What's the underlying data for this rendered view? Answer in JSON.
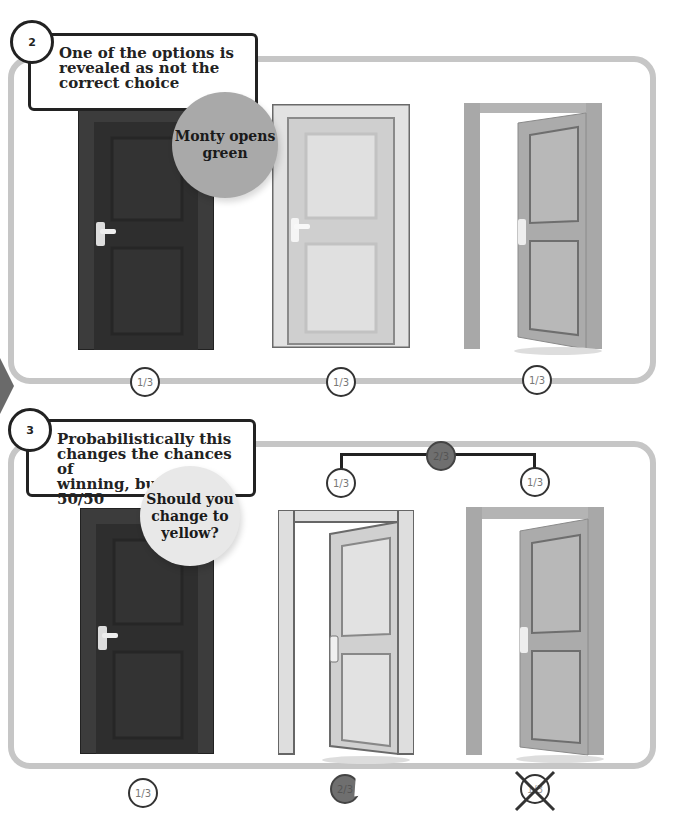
{
  "steps": [
    {
      "number": "2",
      "caption": [
        "One of the options is",
        "revealed as not the",
        "correct choice"
      ],
      "bubble": {
        "lines": [
          "Monty opens",
          "green"
        ],
        "color": "#a9a9a9"
      },
      "doors": [
        {
          "position": "left",
          "style": "dark-closed",
          "color": "#3a3a3a"
        },
        {
          "position": "middle",
          "style": "light-closed",
          "color": "#d6d6d6"
        },
        {
          "position": "right",
          "style": "open",
          "color": "#a8a8a8"
        }
      ],
      "probabilities": [
        "1/3",
        "1/3",
        "1/3"
      ]
    },
    {
      "number": "3",
      "caption": [
        "Probabilistically this",
        "changes the chances of",
        "winning, but not to 50/50"
      ],
      "bubble": {
        "lines": [
          "Should you",
          "change to",
          "yellow?"
        ],
        "color": "#e8e8e8"
      },
      "bracket": {
        "combined": "2/3",
        "left": "1/3",
        "right": "1/3"
      },
      "doors": [
        {
          "position": "left",
          "style": "dark-closed",
          "color": "#3a3a3a"
        },
        {
          "position": "middle",
          "style": "light-open",
          "color": "#d6d6d6"
        },
        {
          "position": "right",
          "style": "open",
          "color": "#a8a8a8"
        }
      ],
      "probabilities": [
        "1/3",
        "2/3",
        "1/3"
      ],
      "eliminated_index": 2
    }
  ],
  "colors": {
    "panel_border": "#c6c6c6",
    "outline": "#222222",
    "dark_probability": "#6f6f6f"
  }
}
